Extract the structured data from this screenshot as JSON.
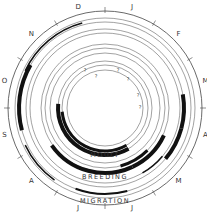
{
  "diagram": {
    "type": "circular annual cycle",
    "center": [
      105,
      108
    ],
    "months": [
      "J",
      "F",
      "M",
      "A",
      "M",
      "J",
      "J",
      "A",
      "S",
      "O",
      "N",
      "D"
    ],
    "band_labels": {
      "moult": "MOULT",
      "breeding": "BREEDING",
      "migration": "MIGRATION"
    },
    "rings": [
      {
        "r": 97,
        "role": "outer-scale"
      },
      {
        "r": 90
      },
      {
        "r": 86
      },
      {
        "r": 79
      },
      {
        "r": 75
      },
      {
        "r": 64
      },
      {
        "r": 60
      },
      {
        "r": 55
      },
      {
        "r": 47
      },
      {
        "r": 43
      },
      {
        "r": 38
      }
    ],
    "bars": [
      {
        "r": 88,
        "start": 295,
        "end": 345,
        "w": 1.6
      },
      {
        "r": 86,
        "start": 255,
        "end": 300,
        "w": 4
      },
      {
        "r": 88,
        "start": 215,
        "end": 245,
        "w": 1.5
      },
      {
        "r": 79,
        "start": 80,
        "end": 105,
        "w": 4
      },
      {
        "r": 79,
        "start": 105,
        "end": 130,
        "w": 4
      },
      {
        "r": 75,
        "start": 130,
        "end": 150,
        "w": 1.5
      },
      {
        "r": 65,
        "start": 115,
        "end": 155,
        "w": 4
      },
      {
        "r": 65,
        "start": 155,
        "end": 235,
        "w": 4
      },
      {
        "r": 60,
        "start": 135,
        "end": 165,
        "w": 3
      },
      {
        "r": 47,
        "start": 150,
        "end": 275,
        "w": 4
      },
      {
        "r": 43,
        "start": 150,
        "end": 265,
        "w": 3
      },
      {
        "r": 86,
        "start": 165,
        "end": 200,
        "w": 2
      }
    ],
    "question_marks": [
      {
        "x": 85,
        "y": 71
      },
      {
        "x": 118,
        "y": 71
      },
      {
        "x": 96,
        "y": 77
      },
      {
        "x": 128,
        "y": 80
      },
      {
        "x": 138,
        "y": 96
      },
      {
        "x": 140,
        "y": 108
      }
    ]
  }
}
